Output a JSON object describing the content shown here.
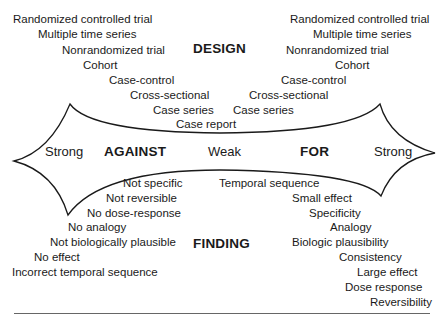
{
  "design": {
    "title": "DESIGN",
    "against": [
      "Randomized controlled trial",
      "Multiple time series",
      "Nonrandomized trial",
      "Cohort",
      "Case-control",
      "Cross-sectional",
      "Case series",
      "Case report"
    ],
    "for": [
      "Randomized controlled trial",
      "Multiple time series",
      "Nonrandomized trial",
      "Cohort",
      "Case-control",
      "Cross-sectional",
      "Case series"
    ]
  },
  "axis": {
    "left_strong": "Strong",
    "against": "AGAINST",
    "weak": "Weak",
    "for": "FOR",
    "right_strong": "Strong"
  },
  "finding": {
    "title": "FINDING",
    "against": [
      "Not specific",
      "Not reversible",
      "No dose-response",
      "No analogy",
      "Not biologically plausible",
      "No effect",
      "Incorrect temporal sequence"
    ],
    "for": [
      "Temporal sequence",
      "Small effect",
      "Specificity",
      "Analogy",
      "Biologic plausibility",
      "Consistency",
      "Large effect",
      "Dose response",
      "Reversibility"
    ]
  },
  "colors": {
    "line": "#1a1a1a",
    "text": "#1a1a1a",
    "rule": "#666666"
  }
}
